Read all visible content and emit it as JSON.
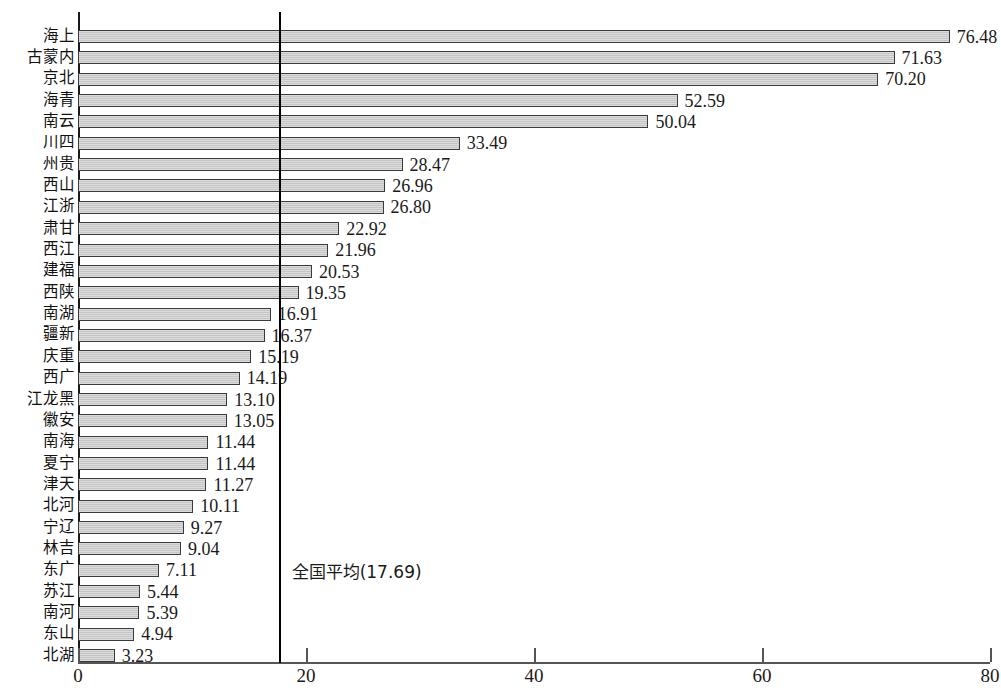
{
  "chart_data": {
    "type": "bar",
    "orientation": "horizontal",
    "title": "",
    "xlabel": "",
    "ylabel": "",
    "xlim": [
      0,
      80
    ],
    "grid": false,
    "legend": null,
    "xticks": [
      0,
      20,
      40,
      60,
      80
    ],
    "xtick_labels": [
      "0",
      "20",
      "40",
      "60",
      "80"
    ],
    "categories": [
      "上海",
      "内蒙古",
      "北京",
      "青海",
      "云南",
      "四川",
      "贵州",
      "山西",
      "浙江",
      "甘肃",
      "江西",
      "福建",
      "陕西",
      "湖南",
      "新疆",
      "重庆",
      "广西",
      "黑龙江",
      "安徽",
      "海南",
      "宁夏",
      "天津",
      "河北",
      "辽宁",
      "吉林",
      "广东",
      "江苏",
      "河南",
      "山东",
      "湖北"
    ],
    "values": [
      76.48,
      71.63,
      70.2,
      52.59,
      50.04,
      33.49,
      28.47,
      26.96,
      26.8,
      22.92,
      21.96,
      20.53,
      19.35,
      16.91,
      16.37,
      15.19,
      14.19,
      13.1,
      13.05,
      11.44,
      11.44,
      11.27,
      10.11,
      9.27,
      9.04,
      7.11,
      5.44,
      5.39,
      4.94,
      3.23
    ],
    "value_labels": [
      "76.48",
      "71.63",
      "70.20",
      "52.59",
      "50.04",
      "33.49",
      "28.47",
      "26.96",
      "26.80",
      "22.92",
      "21.96",
      "20.53",
      "19.35",
      "16.91",
      "16.37",
      "15.19",
      "14.19",
      "13.10",
      "13.05",
      "11.44",
      "11.44",
      "11.27",
      "10.11",
      "9.27",
      "9.04",
      "7.11",
      "5.44",
      "5.39",
      "4.94",
      "3.23"
    ],
    "annotations": [
      {
        "name": "national-average",
        "type": "vline",
        "value": 17.69,
        "label": "全国平均(17.69)"
      }
    ],
    "colors": {
      "bar_fill": "#c9c9c9",
      "bar_border": "#3a3a3a",
      "axis": "#555555",
      "average_line": "#000000",
      "text": "#1a1a1a"
    }
  }
}
